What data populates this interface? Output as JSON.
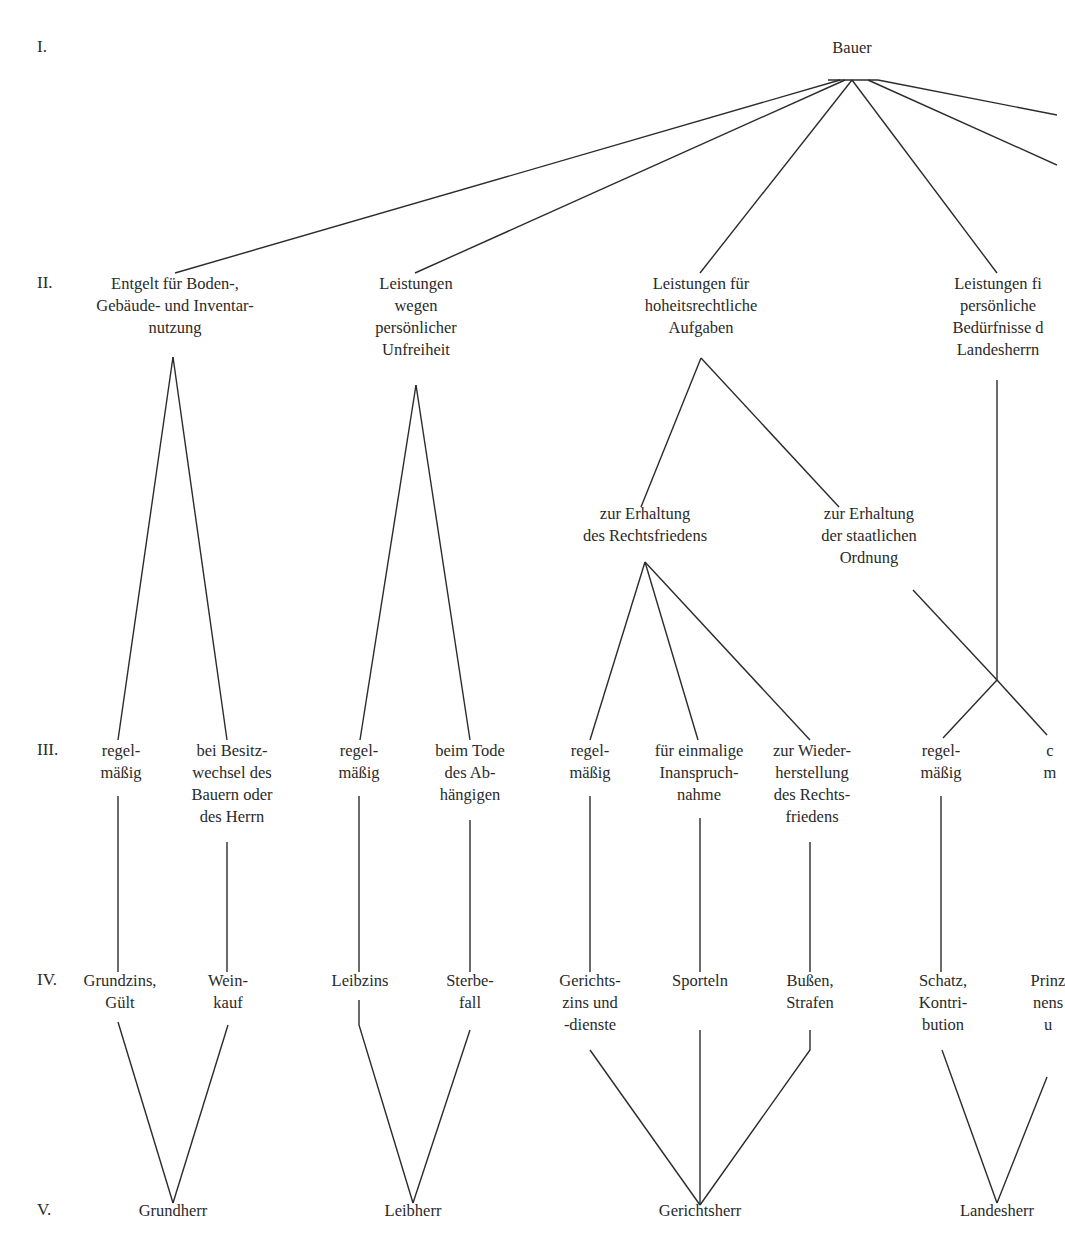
{
  "diagram": {
    "levels": [
      {
        "label": "I.",
        "y": 47
      },
      {
        "label": "II.",
        "y": 283
      },
      {
        "label": "III.",
        "y": 750
      },
      {
        "label": "IV.",
        "y": 980
      },
      {
        "label": "V.",
        "y": 1210
      }
    ],
    "nodes": {
      "bauer": {
        "text": "Bauer",
        "x": 852,
        "y": 47
      },
      "entgelt": {
        "text": "Entgelt für Boden-,\nGebäude- und Inventar-\nnutzung",
        "x": 175,
        "y": 283
      },
      "unfreiheit": {
        "text": "Leistungen\nwegen\npersönlicher\nUnfreiheit",
        "x": 416,
        "y": 283
      },
      "hoheit": {
        "text": "Leistungen für\nhoheitsrechtliche\nAufgaben",
        "x": 701,
        "y": 283
      },
      "landesherrn_beduerfnisse": {
        "text": "Leistungen fi\npersönliche\nBedürfnisse d\nLandesherrn",
        "x": 998,
        "y": 283
      },
      "rechtsfrieden": {
        "text": "zur Erhaltung\ndes Rechtsfriedens",
        "x": 645,
        "y": 513
      },
      "staatliche_ordnung": {
        "text": "zur Erhaltung\nder staatlichen\nOrdnung",
        "x": 869,
        "y": 513
      },
      "regel_1": {
        "text": "regel-\nmäßig",
        "x": 121,
        "y": 750
      },
      "besitzwechsel": {
        "text": "bei Besitz-\nwechsel des\nBauern oder\ndes Herrn",
        "x": 232,
        "y": 750
      },
      "regel_2": {
        "text": "regel-\nmäßig",
        "x": 359,
        "y": 750
      },
      "tode": {
        "text": "beim Tode\ndes Ab-\nhängigen",
        "x": 470,
        "y": 750
      },
      "regel_3": {
        "text": "regel-\nmäßig",
        "x": 590,
        "y": 750
      },
      "einmalig": {
        "text": "für einmalige\nInanspruch-\nnahme",
        "x": 699,
        "y": 750
      },
      "wiederherstellung": {
        "text": "zur Wieder-\nherstellung\ndes Rechts-\nfriedens",
        "x": 812,
        "y": 750
      },
      "regel_4": {
        "text": "regel-\nmäßig",
        "x": 941,
        "y": 750
      },
      "cut_right_3": {
        "text": "c\nm",
        "x": 1050,
        "y": 750
      },
      "grundzins": {
        "text": "Grundzins,\nGült",
        "x": 120,
        "y": 980
      },
      "weinkauf": {
        "text": "Wein-\nkauf",
        "x": 228,
        "y": 980
      },
      "leibzins": {
        "text": "Leibzins",
        "x": 360,
        "y": 980
      },
      "sterbefall": {
        "text": "Sterbe-\nfall",
        "x": 470,
        "y": 980
      },
      "gerichtszins": {
        "text": "Gerichts-\nzins und\n-dienste",
        "x": 590,
        "y": 980
      },
      "sporteln": {
        "text": "Sporteln",
        "x": 700,
        "y": 980
      },
      "bussen": {
        "text": "Bußen,\nStrafen",
        "x": 810,
        "y": 980
      },
      "schatz": {
        "text": "Schatz,\nKontri-\nbution",
        "x": 943,
        "y": 980
      },
      "prinz": {
        "text": "Prinz\nnens\nu",
        "x": 1048,
        "y": 980
      },
      "grundherr": {
        "text": "Grundherr",
        "x": 173,
        "y": 1210
      },
      "leibherr": {
        "text": "Leibherr",
        "x": 413,
        "y": 1210
      },
      "gerichtsherr": {
        "text": "Gerichtsherr",
        "x": 700,
        "y": 1210
      },
      "landesherr": {
        "text": "Landesherr",
        "x": 997,
        "y": 1210
      }
    },
    "edges": [
      [
        [
          828,
          80
        ],
        [
          878,
          80
        ]
      ],
      [
        [
          840,
          80
        ],
        [
          175,
          273
        ]
      ],
      [
        [
          845,
          80
        ],
        [
          415,
          273
        ]
      ],
      [
        [
          852,
          80
        ],
        [
          700,
          273
        ]
      ],
      [
        [
          852,
          80
        ],
        [
          997,
          273
        ]
      ],
      [
        [
          868,
          80
        ],
        [
          1057,
          165
        ]
      ],
      [
        [
          878,
          80
        ],
        [
          1057,
          115
        ]
      ],
      [
        [
          173,
          357
        ],
        [
          118,
          740
        ]
      ],
      [
        [
          173,
          357
        ],
        [
          227,
          740
        ]
      ],
      [
        [
          416,
          385
        ],
        [
          360,
          740
        ]
      ],
      [
        [
          416,
          385
        ],
        [
          470,
          740
        ]
      ],
      [
        [
          701,
          358
        ],
        [
          641,
          507
        ]
      ],
      [
        [
          701,
          358
        ],
        [
          839,
          507
        ]
      ],
      [
        [
          645,
          562
        ],
        [
          590,
          740
        ]
      ],
      [
        [
          645,
          562
        ],
        [
          698,
          740
        ]
      ],
      [
        [
          645,
          562
        ],
        [
          810,
          740
        ]
      ],
      [
        [
          997,
          380
        ],
        [
          997,
          680
        ]
      ],
      [
        [
          913,
          590
        ],
        [
          997,
          680
        ]
      ],
      [
        [
          997,
          680
        ],
        [
          943,
          738
        ]
      ],
      [
        [
          997,
          680
        ],
        [
          1047,
          735
        ]
      ],
      [
        [
          118,
          796
        ],
        [
          118,
          972
        ]
      ],
      [
        [
          227,
          842
        ],
        [
          227,
          972
        ]
      ],
      [
        [
          359,
          796
        ],
        [
          359,
          972
        ]
      ],
      [
        [
          470,
          820
        ],
        [
          470,
          972
        ]
      ],
      [
        [
          590,
          796
        ],
        [
          590,
          972
        ]
      ],
      [
        [
          700,
          818
        ],
        [
          700,
          972
        ]
      ],
      [
        [
          810,
          842
        ],
        [
          810,
          972
        ]
      ],
      [
        [
          941,
          796
        ],
        [
          941,
          972
        ]
      ],
      [
        [
          118,
          1022
        ],
        [
          173,
          1203
        ]
      ],
      [
        [
          228,
          1025
        ],
        [
          173,
          1203
        ]
      ],
      [
        [
          359,
          1000
        ],
        [
          359,
          1025
        ],
        [
          413,
          1203
        ]
      ],
      [
        [
          470,
          1030
        ],
        [
          413,
          1203
        ]
      ],
      [
        [
          590,
          1050
        ],
        [
          700,
          1205
        ]
      ],
      [
        [
          700,
          1030
        ],
        [
          700,
          1205
        ]
      ],
      [
        [
          810,
          1030
        ],
        [
          810,
          1050
        ],
        [
          700,
          1205
        ]
      ],
      [
        [
          942,
          1050
        ],
        [
          997,
          1203
        ]
      ],
      [
        [
          1047,
          1077
        ],
        [
          997,
          1203
        ]
      ]
    ]
  }
}
